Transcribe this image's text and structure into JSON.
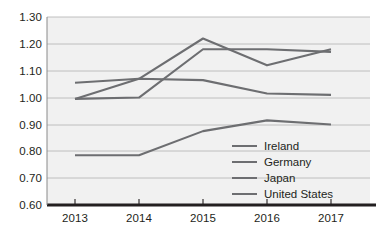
{
  "chart_data": {
    "type": "line",
    "title": "",
    "subtitle": "",
    "xlabel": "",
    "ylabel": "",
    "categories": [
      "2013",
      "2014",
      "2015",
      "2016",
      "2017"
    ],
    "x_tick_labels": [
      "2013",
      "2014",
      "2015",
      "2016",
      "2017"
    ],
    "y_tick_labels": [
      "1.30",
      "1.20",
      "1.10",
      "1.00",
      "0.90",
      "0.80",
      "0.70",
      "0.60"
    ],
    "y_tick_values": [
      1.3,
      1.2,
      1.1,
      1.0,
      0.9,
      0.8,
      0.7,
      0.6
    ],
    "ylim": [
      0.6,
      1.3
    ],
    "grid": true,
    "grid_axis": "y",
    "legend_position": "inside-right",
    "plot_background": "#f1f1f1",
    "series": [
      {
        "name": "Ireland",
        "color": "#6d6e71",
        "values": [
          0.995,
          1.07,
          1.22,
          1.12,
          1.18
        ]
      },
      {
        "name": "Germany",
        "color": "#6d6e71",
        "values": [
          0.995,
          1.0,
          1.18,
          1.18,
          1.17
        ]
      },
      {
        "name": "Japan",
        "color": "#6d6e71",
        "values": [
          0.785,
          0.785,
          0.875,
          0.915,
          0.9
        ]
      },
      {
        "name": "United States",
        "color": "#6d6e71",
        "values": [
          1.055,
          1.07,
          1.065,
          1.015,
          1.01
        ]
      }
    ],
    "legend_entries": [
      "Ireland",
      "Germany",
      "Japan",
      "United States"
    ],
    "axis_color": "#231f20",
    "gridline_color": "#b9b9b9"
  }
}
